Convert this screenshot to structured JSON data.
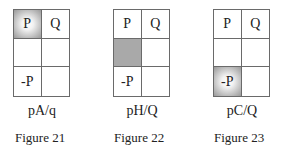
{
  "figures": [
    {
      "caption": "pA/q",
      "label": "Figure 21",
      "cells": [
        [
          "P",
          "Q"
        ],
        [
          "",
          ""
        ],
        [
          "-P",
          ""
        ]
      ],
      "shaded": {
        "row": 0,
        "col": 0,
        "style": "radial"
      }
    },
    {
      "caption": "pH/Q",
      "label": "Figure 22",
      "cells": [
        [
          "P",
          "Q"
        ],
        [
          "",
          ""
        ],
        [
          "-P",
          ""
        ]
      ],
      "shaded": {
        "row": 1,
        "col": 0,
        "style": "flat"
      }
    },
    {
      "caption": "pC/Q",
      "label": "Figure 23",
      "cells": [
        [
          "P",
          "Q"
        ],
        [
          "",
          ""
        ],
        [
          "-P",
          ""
        ]
      ],
      "shaded": {
        "row": 2,
        "col": 0,
        "style": "radial"
      }
    }
  ],
  "colors": {
    "grid_line": "#6a6a6a",
    "shade": "#a9a9a9",
    "text": "#222222"
  }
}
